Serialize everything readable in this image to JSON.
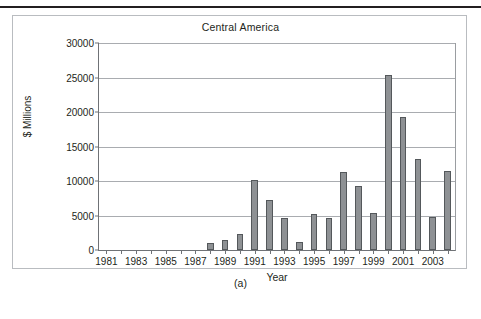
{
  "figure": {
    "caption": "(a)"
  },
  "chart_data": {
    "type": "bar",
    "title": "Central America",
    "xlabel": "Year",
    "ylabel": "$ Millions",
    "ylim": [
      0,
      30000
    ],
    "ytick_labels": [
      "0",
      "5000",
      "10000",
      "15000",
      "20000",
      "25000",
      "30000"
    ],
    "ytick_values": [
      0,
      5000,
      10000,
      15000,
      20000,
      25000,
      30000
    ],
    "grid": true,
    "legend": "none",
    "xtick_labels": [
      "1981",
      "1983",
      "1985",
      "1987",
      "1989",
      "1991",
      "1993",
      "1995",
      "1997",
      "1999",
      "2001",
      "2003"
    ],
    "categories": [
      "1981",
      "1982",
      "1983",
      "1984",
      "1985",
      "1986",
      "1987",
      "1988",
      "1989",
      "1990",
      "1991",
      "1992",
      "1993",
      "1994",
      "1995",
      "1996",
      "1997",
      "1998",
      "1999",
      "2000",
      "2001",
      "2002",
      "2003",
      "2004"
    ],
    "values": [
      0,
      0,
      0,
      0,
      0,
      0,
      0,
      950,
      1450,
      2250,
      10200,
      7200,
      4650,
      1200,
      5250,
      4600,
      11250,
      9300,
      5400,
      25400,
      19350,
      13150,
      4800,
      11450
    ]
  }
}
